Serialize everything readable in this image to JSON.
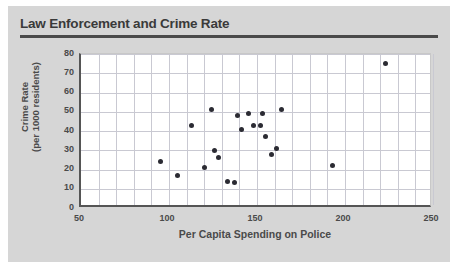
{
  "chart_data": {
    "type": "scatter",
    "title": "Law Enforcement and Crime Rate",
    "xlabel": "Per Capita Spending on Police",
    "ylabel_line1": "Crime Rate",
    "ylabel_line2": "(per 1000 residents)",
    "xlim": [
      50,
      250
    ],
    "ylim": [
      0,
      80
    ],
    "xticks": [
      50,
      100,
      150,
      200,
      250
    ],
    "yticks": [
      0,
      10,
      20,
      30,
      40,
      50,
      60,
      70,
      80
    ],
    "x_minor_step": 10,
    "y_minor_step": 10,
    "grid": true,
    "legend": null,
    "marker_color": "#2b2b33",
    "points": [
      {
        "x": 95,
        "y": 24
      },
      {
        "x": 105,
        "y": 17
      },
      {
        "x": 113,
        "y": 43
      },
      {
        "x": 120,
        "y": 21
      },
      {
        "x": 124,
        "y": 51
      },
      {
        "x": 126,
        "y": 30
      },
      {
        "x": 128,
        "y": 26
      },
      {
        "x": 133,
        "y": 14
      },
      {
        "x": 137,
        "y": 13
      },
      {
        "x": 139,
        "y": 48
      },
      {
        "x": 141,
        "y": 41
      },
      {
        "x": 145,
        "y": 49
      },
      {
        "x": 148,
        "y": 43
      },
      {
        "x": 152,
        "y": 43
      },
      {
        "x": 153,
        "y": 49
      },
      {
        "x": 155,
        "y": 37
      },
      {
        "x": 158,
        "y": 28
      },
      {
        "x": 161,
        "y": 31
      },
      {
        "x": 164,
        "y": 51
      },
      {
        "x": 193,
        "y": 22
      },
      {
        "x": 223,
        "y": 75
      }
    ]
  }
}
